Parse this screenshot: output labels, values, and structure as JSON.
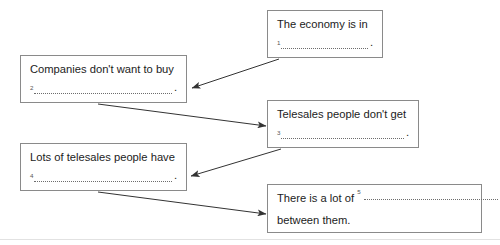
{
  "worksheet": {
    "type": "gap-fill-flow-diagram",
    "boxes": [
      {
        "id": "box-1",
        "text": "The economy is in",
        "gap_number": "1",
        "trailing_mark": "."
      },
      {
        "id": "box-2",
        "text": "Companies don't want to buy",
        "gap_number": "2",
        "trailing_mark": "."
      },
      {
        "id": "box-3",
        "text": "Telesales people don't get",
        "gap_number": "3",
        "trailing_mark": "."
      },
      {
        "id": "box-4",
        "text": "Lots of telesales people have",
        "gap_number": "4",
        "trailing_mark": "."
      },
      {
        "id": "box-5",
        "text": "There is a lot of",
        "gap_number": "5",
        "text_line2": "between them.",
        "trailing_mark": ""
      }
    ],
    "arrows": [
      {
        "id": "arrow-1",
        "from": "box-1",
        "to": "box-2"
      },
      {
        "id": "arrow-2",
        "from": "box-2",
        "to": "box-3"
      },
      {
        "id": "arrow-3",
        "from": "box-3",
        "to": "box-4"
      },
      {
        "id": "arrow-4",
        "from": "box-4",
        "to": "box-5"
      }
    ],
    "colors": {
      "box_border": "#8a8a8a",
      "text": "#1c1c1c",
      "arrow": "#333333",
      "dotted_line": "#6d6d6d",
      "background": "#ffffff"
    }
  }
}
